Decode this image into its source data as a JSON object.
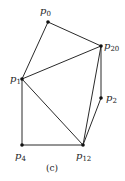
{
  "diagram": {
    "caption": "(c)",
    "nodes": [
      {
        "id": "p0",
        "label": "p",
        "sub": "0",
        "x": 48,
        "y": 22,
        "lx": 40,
        "ly": 14
      },
      {
        "id": "p20",
        "label": "p",
        "sub": "20",
        "x": 101,
        "y": 46,
        "lx": 104,
        "ly": 49
      },
      {
        "id": "p1",
        "label": "p",
        "sub": "1",
        "x": 22,
        "y": 79,
        "lx": 10,
        "ly": 82
      },
      {
        "id": "p2",
        "label": "p",
        "sub": "2",
        "x": 101,
        "y": 98,
        "lx": 106,
        "ly": 101
      },
      {
        "id": "p4",
        "label": "p",
        "sub": "4",
        "x": 22,
        "y": 145,
        "lx": 15,
        "ly": 159
      },
      {
        "id": "p12",
        "label": "p",
        "sub": "12",
        "x": 83,
        "y": 145,
        "lx": 76,
        "ly": 159
      }
    ],
    "edges": [
      [
        "p0",
        "p1"
      ],
      [
        "p0",
        "p20"
      ],
      [
        "p1",
        "p20"
      ],
      [
        "p1",
        "p4"
      ],
      [
        "p1",
        "p12"
      ],
      [
        "p4",
        "p12"
      ],
      [
        "p20",
        "p12"
      ],
      [
        "p20",
        "p2"
      ],
      [
        "p2",
        "p12"
      ]
    ],
    "colors": {
      "stroke": "#2a2a2a",
      "node": "#111111"
    }
  }
}
